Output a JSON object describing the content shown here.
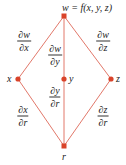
{
  "diagram": {
    "type": "dependency-tree",
    "colors": {
      "edge": "#e2786a",
      "node": "#d9432a",
      "text": "#222222"
    },
    "nodes": [
      {
        "id": "w",
        "label": "w = f(x, y, z)",
        "x": 64,
        "y": 16
      },
      {
        "id": "x",
        "label": "x",
        "x": 18,
        "y": 79
      },
      {
        "id": "y",
        "label": "y",
        "x": 64,
        "y": 79
      },
      {
        "id": "z",
        "label": "z",
        "x": 111,
        "y": 79
      },
      {
        "id": "r",
        "label": "r",
        "x": 64,
        "y": 146
      }
    ],
    "edges": [
      {
        "from": "w",
        "to": "x",
        "label": {
          "num": "∂w",
          "den": "∂x"
        }
      },
      {
        "from": "w",
        "to": "y",
        "label": {
          "num": "∂w",
          "den": "∂y"
        }
      },
      {
        "from": "w",
        "to": "z",
        "label": {
          "num": "∂w",
          "den": "∂z"
        }
      },
      {
        "from": "x",
        "to": "r",
        "label": {
          "num": "∂x",
          "den": "∂r"
        }
      },
      {
        "from": "y",
        "to": "r",
        "label": {
          "num": "∂y",
          "den": "∂r"
        }
      },
      {
        "from": "z",
        "to": "r",
        "label": {
          "num": "∂z",
          "den": "∂r"
        }
      }
    ]
  }
}
